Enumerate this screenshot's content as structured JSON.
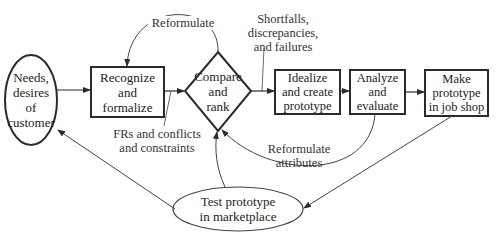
{
  "diagram": {
    "nodes": [
      {
        "id": "needs",
        "shape": "ellipse",
        "lines": [
          "Needs,",
          "desires",
          "of",
          "customer"
        ]
      },
      {
        "id": "recognize",
        "shape": "box",
        "lines": [
          "Recognize and",
          "formalize"
        ]
      },
      {
        "id": "compare",
        "shape": "diamond",
        "lines": [
          "Compare",
          "and",
          "rank"
        ]
      },
      {
        "id": "idealize",
        "shape": "box",
        "lines": [
          "Idealize",
          "and create",
          "prototype"
        ]
      },
      {
        "id": "analyze",
        "shape": "box",
        "lines": [
          "Analyze",
          "and",
          "evaluate"
        ]
      },
      {
        "id": "make",
        "shape": "box",
        "lines": [
          "Make",
          "prototype",
          "in job shop"
        ]
      },
      {
        "id": "test",
        "shape": "ellipse",
        "lines": [
          "Test prototype",
          "in marketplace"
        ]
      }
    ],
    "annotations": {
      "reformulate": "Reformulate",
      "shortfalls": [
        "Shortfalls,",
        "discrepancies,",
        "and failures"
      ],
      "frs": [
        "FRs and conflicts",
        "and constraints"
      ],
      "reformulate_attributes": [
        "Reformulate",
        "attributes"
      ]
    },
    "edges": [
      {
        "from": "needs",
        "to": "recognize"
      },
      {
        "from": "recognize",
        "to": "compare"
      },
      {
        "from": "compare",
        "to": "recognize",
        "label": "Reformulate"
      },
      {
        "from": "compare",
        "to": "idealize"
      },
      {
        "from": "idealize",
        "to": "analyze"
      },
      {
        "from": "analyze",
        "to": "make"
      },
      {
        "from": "analyze",
        "to": "compare",
        "label": "Reformulate attributes"
      },
      {
        "from": "make",
        "to": "test"
      },
      {
        "from": "test",
        "to": "needs"
      },
      {
        "from": "test",
        "to": "compare"
      }
    ],
    "colors": {
      "stroke": "#2a2a2a",
      "thin_stroke": "#444444",
      "background": "#ffffff"
    }
  }
}
